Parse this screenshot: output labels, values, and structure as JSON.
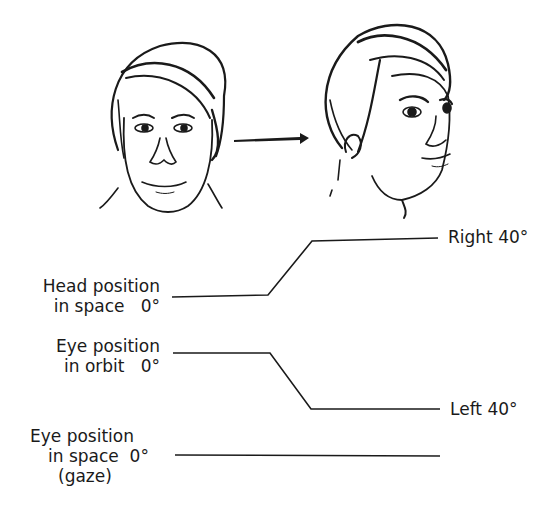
{
  "figure": {
    "illustrations": [
      {
        "name": "face-front",
        "description": "Head facing forward, eyes forward"
      },
      {
        "name": "face-turned",
        "description": "Head turned right, eyes looking forward"
      }
    ],
    "arrow": "right-arrow"
  },
  "labels": {
    "head": {
      "line1": "Head position",
      "line2": "in space   0°"
    },
    "orbit": {
      "line1": "Eye position",
      "line2": "in orbit   0°"
    },
    "gaze": {
      "line1": "Eye position",
      "line2": "in space  0°",
      "line3": "(gaze)"
    },
    "right": "Right 40°",
    "left": "Left 40°"
  },
  "traces": {
    "head": {
      "start": "0°",
      "end": "Right 40°"
    },
    "orbit": {
      "start": "0°",
      "end": "Left 40°"
    },
    "gaze": {
      "start": "0°",
      "end": "0°"
    }
  },
  "colors": {
    "ink": "#1a1a1a",
    "background": "#ffffff"
  }
}
